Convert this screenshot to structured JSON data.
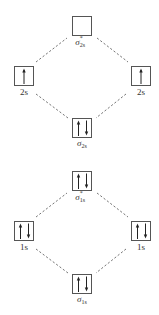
{
  "diagram": {
    "colors": {
      "box_stroke": "#555555",
      "arrow": "#222222",
      "dash": "#666666",
      "background": "#ffffff"
    },
    "upper": {
      "antibonding": {
        "symbol": "σ",
        "subscript": "2s",
        "superscript": "*",
        "electrons": [],
        "arrows_icon": "empty"
      },
      "left_atomic": {
        "label": "2s",
        "electrons": [
          "up"
        ],
        "arrows_icon": "single-up-arrow"
      },
      "right_atomic": {
        "label": "2s",
        "electrons": [
          "up"
        ],
        "arrows_icon": "single-up-arrow"
      },
      "bonding": {
        "symbol": "σ",
        "subscript": "2s",
        "superscript": "",
        "electrons": [
          "up",
          "down"
        ],
        "arrows_icon": "paired-arrows"
      }
    },
    "lower": {
      "antibonding": {
        "symbol": "σ",
        "subscript": "1s",
        "superscript": "*",
        "electrons": [
          "up",
          "down"
        ],
        "arrows_icon": "paired-arrows"
      },
      "left_atomic": {
        "label": "1s",
        "electrons": [
          "up",
          "down"
        ],
        "arrows_icon": "paired-arrows"
      },
      "right_atomic": {
        "label": "1s",
        "electrons": [
          "up",
          "down"
        ],
        "arrows_icon": "paired-arrows"
      },
      "bonding": {
        "symbol": "σ",
        "subscript": "1s",
        "superscript": "",
        "electrons": [
          "up",
          "down"
        ],
        "arrows_icon": "paired-arrows"
      }
    }
  }
}
